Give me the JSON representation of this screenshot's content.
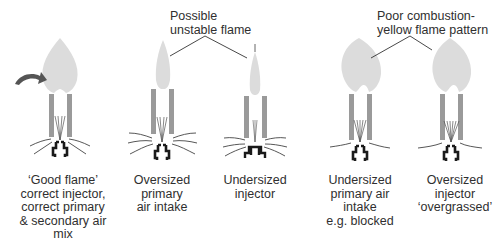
{
  "callouts": [
    {
      "id": "unstable",
      "text": "Possible\nunstable flame"
    },
    {
      "id": "poor",
      "text": "Poor combustion-\nyellow flame pattern"
    }
  ],
  "burners": [
    {
      "id": "good",
      "caption": "‘Good flame’\ncorrect injector,\ncorrect primary\n& secondary air\nmix"
    },
    {
      "id": "oversized-primary",
      "caption": "Oversized\nprimary\nair intake"
    },
    {
      "id": "undersized-injector",
      "caption": "Undersized\ninjector"
    },
    {
      "id": "undersized-primary",
      "caption": "Undersized\nprimary air\nintake\ne.g. blocked"
    },
    {
      "id": "oversized-injector",
      "caption": "Oversized\ninjector\n‘overgrassed’"
    }
  ],
  "colors": {
    "flame": "#dcdcdc",
    "tube": "#9a9a9a",
    "injector": "#1a1a1a",
    "arrow": "#555555",
    "line": "#333333"
  }
}
